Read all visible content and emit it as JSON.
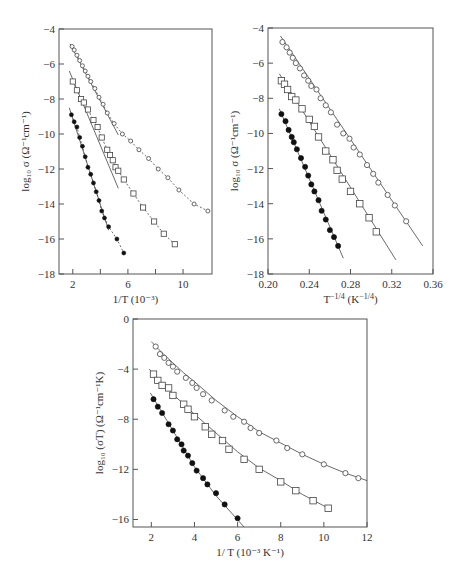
{
  "chart_data": [
    {
      "id": "top-left",
      "type": "scatter",
      "title": "",
      "xlabel": "1/T (10⁻³)",
      "ylabel": "log₁₀ σ (Ω⁻¹cm⁻¹)",
      "xlim": [
        1.0,
        12.1
      ],
      "ylim": [
        -18,
        -4
      ],
      "xticks": [
        2,
        4,
        6,
        8,
        10
      ],
      "xticklabels": [
        "2",
        "",
        "6",
        "",
        "10"
      ],
      "yticks": [
        -4,
        -6,
        -8,
        -10,
        -12,
        -14,
        -16,
        -18
      ],
      "yticklabels": [
        "−4",
        "−6",
        "−8",
        "−10",
        "−12",
        "−14",
        "−16",
        "−18"
      ],
      "grid": false,
      "box": {
        "left": 59,
        "top": 29,
        "right": 212,
        "bottom": 274
      },
      "series": [
        {
          "name": "open circles",
          "marker": "circle-open",
          "line": "dashed",
          "x": [
            1.95,
            2.1,
            2.3,
            2.5,
            2.7,
            2.9,
            3.1,
            3.3,
            3.6,
            3.9,
            4.2,
            4.5,
            5.0,
            5.6,
            6.2,
            6.8,
            7.5,
            8.2,
            8.9,
            9.7,
            10.8,
            11.8
          ],
          "y": [
            -5.0,
            -5.2,
            -5.5,
            -5.8,
            -6.1,
            -6.4,
            -6.7,
            -7.0,
            -7.4,
            -7.9,
            -8.3,
            -8.8,
            -9.4,
            -10.0,
            -10.4,
            -10.9,
            -11.4,
            -12.0,
            -12.5,
            -13.2,
            -14.0,
            -14.4
          ],
          "fit": {
            "x": [
              1.8,
              5.3
            ],
            "y": [
              -4.85,
              -10.05
            ]
          }
        },
        {
          "name": "open squares",
          "marker": "square-open",
          "line": "dashed",
          "x": [
            2.0,
            2.3,
            2.6,
            2.8,
            3.1,
            3.5,
            3.8,
            4.1,
            4.5,
            4.7,
            4.9,
            5.1,
            5.3,
            5.7,
            6.4,
            7.1,
            7.9,
            8.6,
            9.4
          ],
          "y": [
            -7.0,
            -7.5,
            -8.0,
            -8.2,
            -8.6,
            -9.2,
            -9.6,
            -10.2,
            -10.9,
            -11.2,
            -11.5,
            -11.9,
            -12.1,
            -12.6,
            -13.4,
            -14.2,
            -15.0,
            -15.7,
            -16.3
          ],
          "fit": {
            "x": [
              1.75,
              5.3
            ],
            "y": [
              -6.4,
              -13.1
            ]
          }
        },
        {
          "name": "filled circles",
          "marker": "circle-filled",
          "line": "dashed",
          "x": [
            1.9,
            2.1,
            2.3,
            2.5,
            2.7,
            2.9,
            3.1,
            3.3,
            3.5,
            3.7,
            3.9,
            4.1,
            4.3,
            4.6,
            5.2,
            5.7
          ],
          "y": [
            -8.9,
            -9.3,
            -9.6,
            -10.2,
            -10.7,
            -11.3,
            -11.9,
            -12.3,
            -12.8,
            -13.3,
            -13.8,
            -14.4,
            -14.8,
            -15.3,
            -16.0,
            -16.8
          ],
          "fit": {
            "x": [
              1.75,
              4.6
            ],
            "y": [
              -8.5,
              -15.5
            ]
          }
        }
      ]
    },
    {
      "id": "top-right",
      "type": "scatter",
      "title": "",
      "xlabel": "T⁻¹ᐟ⁴ (K⁻¹ᐟ⁴)",
      "xlabel_parts": {
        "base": "T",
        "exp": "−1/4",
        "unit_base": "(K",
        "unit_exp": "−1/4",
        "close": ")"
      },
      "ylabel": "log₁₀ σ (Ω⁻¹cm⁻¹)",
      "xlim": [
        0.2,
        0.36
      ],
      "ylim": [
        -18,
        -4
      ],
      "xticks": [
        0.2,
        0.24,
        0.28,
        0.32,
        0.36
      ],
      "xticklabels": [
        "0.20",
        "0.24",
        "0.28",
        "0.32",
        "0.36"
      ],
      "yticks": [
        -4,
        -6,
        -8,
        -10,
        -12,
        -14,
        -16,
        -18
      ],
      "yticklabels": [
        "−4",
        "−6",
        "−8",
        "−10",
        "−12",
        "−14",
        "−16",
        "−18"
      ],
      "grid": false,
      "box": {
        "left": 268,
        "top": 28,
        "right": 433,
        "bottom": 274
      },
      "series": [
        {
          "name": "open circles",
          "marker": "circle-open",
          "line": "solid",
          "x": [
            0.214,
            0.218,
            0.221,
            0.224,
            0.227,
            0.231,
            0.235,
            0.239,
            0.242,
            0.247,
            0.251,
            0.256,
            0.261,
            0.267,
            0.273,
            0.279,
            0.283,
            0.289,
            0.296,
            0.302,
            0.307,
            0.316,
            0.323,
            0.334
          ],
          "y": [
            -4.8,
            -5.1,
            -5.4,
            -5.7,
            -6.0,
            -6.3,
            -6.7,
            -7.0,
            -7.3,
            -7.5,
            -8.0,
            -8.4,
            -8.8,
            -9.5,
            -10.0,
            -10.3,
            -10.8,
            -11.2,
            -11.8,
            -12.3,
            -12.8,
            -13.5,
            -14.1,
            -15.0
          ],
          "fit": {
            "x": [
              0.212,
              0.35
            ],
            "y": [
              -4.45,
              -16.4
            ]
          }
        },
        {
          "name": "open squares",
          "marker": "square-open",
          "line": "solid",
          "x": [
            0.213,
            0.216,
            0.219,
            0.223,
            0.227,
            0.233,
            0.24,
            0.245,
            0.249,
            0.256,
            0.263,
            0.267,
            0.272,
            0.28,
            0.289,
            0.298,
            0.305
          ],
          "y": [
            -7.0,
            -7.2,
            -7.5,
            -7.9,
            -8.1,
            -8.6,
            -9.2,
            -9.6,
            -10.2,
            -11.0,
            -11.5,
            -12.1,
            -12.6,
            -13.3,
            -14.0,
            -14.8,
            -15.6
          ],
          "fit": {
            "x": [
              0.211,
              0.324
            ],
            "y": [
              -6.6,
              -17.2
            ]
          }
        },
        {
          "name": "filled circles",
          "marker": "circle-filled",
          "line": "solid",
          "x": [
            0.213,
            0.217,
            0.22,
            0.223,
            0.225,
            0.228,
            0.232,
            0.236,
            0.239,
            0.242,
            0.245,
            0.249,
            0.252,
            0.256,
            0.26,
            0.264,
            0.268
          ],
          "y": [
            -8.9,
            -9.3,
            -9.8,
            -10.2,
            -10.5,
            -10.9,
            -11.4,
            -11.9,
            -12.4,
            -12.9,
            -13.3,
            -13.8,
            -14.4,
            -14.9,
            -15.5,
            -15.9,
            -16.4
          ],
          "fit": {
            "x": [
              0.211,
              0.273
            ],
            "y": [
              -8.6,
              -17.1
            ]
          }
        }
      ]
    },
    {
      "id": "bottom",
      "type": "scatter",
      "title": "",
      "xlabel": "1/ T (10⁻³ K⁻¹)",
      "ylabel": "log₁₀ (σT) (Ω⁻¹cm⁻¹K)",
      "xlim": [
        1.15,
        12
      ],
      "ylim": [
        -16.6,
        0
      ],
      "xticks": [
        2,
        4,
        6,
        8,
        10,
        12
      ],
      "xticklabels": [
        "2",
        "4",
        "6",
        "8",
        "10",
        "12"
      ],
      "yticks": [
        0,
        -4,
        -8,
        -12,
        -16
      ],
      "yticklabels": [
        "0",
        "−4",
        "−8",
        "−12",
        "−16"
      ],
      "grid": false,
      "box": {
        "left": 133,
        "top": 319,
        "right": 367,
        "bottom": 527
      },
      "series": [
        {
          "name": "open circles",
          "marker": "circle-open",
          "line": "solid",
          "x": [
            2.2,
            2.4,
            2.6,
            2.8,
            3.0,
            3.2,
            3.6,
            3.9,
            4.1,
            4.4,
            4.8,
            5.4,
            5.8,
            6.3,
            6.6,
            7.0,
            7.8,
            8.3,
            9.0,
            10.0,
            11.0,
            11.6
          ],
          "y": [
            -2.2,
            -2.8,
            -3.1,
            -3.5,
            -3.8,
            -4.2,
            -4.7,
            -5.1,
            -5.5,
            -6.0,
            -6.5,
            -7.3,
            -7.8,
            -8.2,
            -8.7,
            -9.1,
            -9.7,
            -10.3,
            -10.8,
            -11.6,
            -12.3,
            -12.7
          ],
          "fit": {
            "x": [
              2.0,
              2.5,
              3.0,
              3.5,
              4.0,
              5.0,
              6.0,
              7.0,
              8.0,
              9.0,
              10.0,
              11.0,
              12.0
            ],
            "y": [
              -1.8,
              -2.7,
              -3.5,
              -4.3,
              -5.0,
              -6.5,
              -7.8,
              -9.0,
              -9.9,
              -10.8,
              -11.6,
              -12.3,
              -12.9
            ]
          }
        },
        {
          "name": "open squares",
          "marker": "square-open",
          "line": "solid",
          "x": [
            2.1,
            2.3,
            2.5,
            2.8,
            3.0,
            3.5,
            3.7,
            4.0,
            4.5,
            4.8,
            5.3,
            5.6,
            6.3,
            7.0,
            8.0,
            8.7,
            9.5,
            10.2
          ],
          "y": [
            -4.4,
            -4.9,
            -5.3,
            -5.5,
            -6.1,
            -6.8,
            -7.2,
            -7.8,
            -8.6,
            -9.2,
            -9.7,
            -10.4,
            -11.2,
            -12.0,
            -13.0,
            -13.7,
            -14.5,
            -15.1
          ],
          "fit": {
            "x": [
              1.9,
              2.5,
              3.0,
              3.5,
              4.0,
              5.0,
              6.0,
              7.0,
              8.0,
              9.0,
              10.2
            ],
            "y": [
              -4.0,
              -5.1,
              -6.0,
              -6.8,
              -7.6,
              -9.1,
              -10.6,
              -11.9,
              -12.9,
              -14.0,
              -15.1
            ]
          }
        },
        {
          "name": "filled circles",
          "marker": "circle-filled",
          "line": "solid",
          "x": [
            2.1,
            2.3,
            2.5,
            2.8,
            3.0,
            3.2,
            3.4,
            3.5,
            3.7,
            3.9,
            4.1,
            4.4,
            4.6,
            5.0,
            5.4,
            6.0
          ],
          "y": [
            -6.4,
            -7.0,
            -7.5,
            -8.4,
            -8.9,
            -9.6,
            -10.0,
            -10.5,
            -10.9,
            -11.5,
            -12.1,
            -12.7,
            -13.2,
            -13.9,
            -14.8,
            -15.9
          ],
          "fit": {
            "x": [
              1.95,
              3.0,
              4.0,
              5.0,
              6.3
            ],
            "y": [
              -5.9,
              -8.9,
              -11.8,
              -14.1,
              -16.6
            ]
          }
        }
      ]
    }
  ]
}
